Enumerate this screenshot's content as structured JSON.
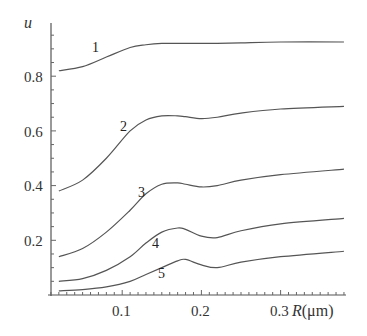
{
  "chart_data": {
    "type": "line",
    "title": "",
    "xlabel": "R(μm)",
    "ylabel": "u",
    "xlim": [
      0.0,
      0.38
    ],
    "ylim": [
      0.0,
      1.0
    ],
    "grid": false,
    "legend": "inline curve numbers",
    "x_ticks": [
      "0.1",
      "0.2",
      "0.3"
    ],
    "y_ticks": [
      "0.2",
      "0.4",
      "0.6",
      "0.8"
    ],
    "x": [
      0.02,
      0.05,
      0.08,
      0.11,
      0.13,
      0.15,
      0.17,
      0.18,
      0.2,
      0.22,
      0.25,
      0.3,
      0.38
    ],
    "series": [
      {
        "name": "1",
        "values": [
          0.82,
          0.835,
          0.87,
          0.905,
          0.915,
          0.92,
          0.92,
          0.92,
          0.92,
          0.92,
          0.922,
          0.925,
          0.925
        ]
      },
      {
        "name": "2",
        "values": [
          0.38,
          0.42,
          0.5,
          0.6,
          0.64,
          0.655,
          0.655,
          0.652,
          0.645,
          0.65,
          0.665,
          0.68,
          0.69
        ]
      },
      {
        "name": "3",
        "values": [
          0.14,
          0.17,
          0.23,
          0.31,
          0.37,
          0.405,
          0.41,
          0.405,
          0.395,
          0.4,
          0.42,
          0.44,
          0.46
        ]
      },
      {
        "name": "4",
        "values": [
          0.05,
          0.06,
          0.09,
          0.14,
          0.19,
          0.23,
          0.245,
          0.24,
          0.215,
          0.21,
          0.235,
          0.26,
          0.28
        ]
      },
      {
        "name": "5",
        "values": [
          0.015,
          0.02,
          0.03,
          0.05,
          0.075,
          0.1,
          0.125,
          0.13,
          0.11,
          0.1,
          0.12,
          0.14,
          0.16
        ]
      }
    ],
    "curve_labels": [
      {
        "text": "1",
        "x": 0.07,
        "y": 0.92
      },
      {
        "text": "2",
        "x": 0.107,
        "y": 0.6
      },
      {
        "text": "3",
        "x": 0.125,
        "y": 0.36
      },
      {
        "text": "4",
        "x": 0.143,
        "y": 0.18
      },
      {
        "text": "5",
        "x": 0.148,
        "y": 0.085
      }
    ]
  },
  "labels": {
    "y_axis": "u",
    "x_axis_var": "R",
    "x_axis_unit": "(μm)",
    "x_tick_1": "0.1",
    "x_tick_2": "0.2",
    "x_tick_3": "0.3",
    "y_tick_1": "0.2",
    "y_tick_2": "0.4",
    "y_tick_3": "0.6",
    "y_tick_4": "0.8",
    "curve_1": "1",
    "curve_2": "2",
    "curve_3": "3",
    "curve_4": "4",
    "curve_5": "5"
  }
}
